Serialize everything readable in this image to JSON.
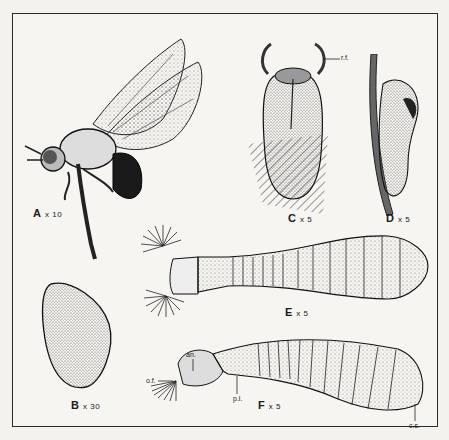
{
  "plate": {
    "figures": [
      {
        "id": "A",
        "letter": "A",
        "magnification": "x 10",
        "subject": "adult-fly"
      },
      {
        "id": "B",
        "letter": "B",
        "magnification": "x 30",
        "subject": "egg"
      },
      {
        "id": "C",
        "letter": "C",
        "magnification": "x 5",
        "subject": "puparium-dorsal"
      },
      {
        "id": "D",
        "letter": "D",
        "magnification": "x 5",
        "subject": "puparium-lateral"
      },
      {
        "id": "E",
        "letter": "E",
        "magnification": "x 5",
        "subject": "larva-dorsal"
      },
      {
        "id": "F",
        "letter": "F",
        "magnification": "x 5",
        "subject": "larva-lateral"
      }
    ],
    "annotations": {
      "rf": "r.f.",
      "an": "an.",
      "of": "o.f.",
      "pl": "p.l.",
      "cs": "c.s."
    }
  },
  "colors": {
    "ink": "#1a1a1a",
    "paper": "#f6f5f1",
    "stipple": "#8a8a86"
  }
}
